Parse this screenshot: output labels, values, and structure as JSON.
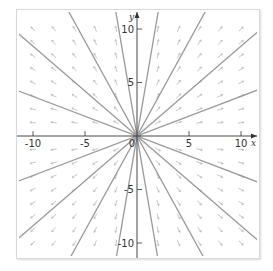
{
  "chart_data": {
    "type": "line",
    "subtype": "phase-portrait-direction-field",
    "title": "",
    "xlabel": "x",
    "ylabel": "y",
    "xlim": [
      -10.5,
      11.5
    ],
    "ylim": [
      -11.5,
      11.5
    ],
    "x_ticks": [
      -10,
      -5,
      0,
      5,
      10
    ],
    "x_tick_labels": [
      "-10",
      "-5",
      "0",
      "5",
      "10"
    ],
    "y_ticks": [
      -10,
      -5,
      5,
      10
    ],
    "y_tick_labels": [
      "-10",
      "-5",
      "5",
      "10"
    ],
    "grid": false,
    "legend": null,
    "trajectory_slopes": [
      0.37,
      -0.37,
      0.84,
      -0.84,
      1.77,
      -1.77,
      5.7,
      -5.7
    ],
    "direction_field": {
      "grid_x": [
        -10,
        -8,
        -6,
        -4,
        -2,
        2,
        4,
        6,
        8,
        10
      ],
      "grid_y": [
        -10,
        -8.75,
        -7.5,
        -6.25,
        -5,
        -3.75,
        -2.5,
        -1.25,
        1.25,
        2.5,
        3.75,
        5,
        6.25,
        7.5,
        8.75,
        10
      ],
      "vector_rule": "radial outward (dx/dt = x, dy/dt = y)"
    },
    "colors": {
      "trajectory": "#9a9a9a",
      "field": "#b8b8b8",
      "axis": "#333333",
      "origin_blob": "#a0a0a0"
    }
  },
  "labels": {
    "x_axis": "x",
    "y_axis": "y",
    "origin": "0"
  }
}
